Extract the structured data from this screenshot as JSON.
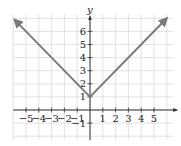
{
  "chart_data": {
    "type": "line",
    "title": "",
    "function": "y = |x| + 1",
    "xlabel": "x",
    "ylabel": "y",
    "xlim": [
      -6,
      6.5
    ],
    "ylim": [
      -2.3,
      7.3
    ],
    "grid": true,
    "x_ticks": [
      -5,
      -4,
      -3,
      -2,
      -1,
      1,
      2,
      3,
      4,
      5
    ],
    "x_tick_labels": [
      "−5",
      "−4",
      "−3",
      "−2",
      "−1",
      "1",
      "2",
      "3",
      "4",
      "5"
    ],
    "y_ticks": [
      -1,
      1,
      2,
      3,
      4,
      5,
      6
    ],
    "y_tick_labels": [
      "−1",
      "1",
      "2",
      "3",
      "4",
      "5",
      "6"
    ],
    "series": [
      {
        "name": "y = |x| + 1",
        "x": [
          -5.9,
          0,
          6.0
        ],
        "y": [
          6.9,
          1,
          7.0
        ],
        "color": "#7a7a7a",
        "arrows": "both-ends"
      }
    ],
    "vertex": {
      "x": 0,
      "y": 1
    }
  },
  "layout": {
    "origin_px": [
      90,
      110
    ],
    "unit_x_px": 12.8,
    "unit_y_px": 13.1,
    "grid_color": "#d9d9d9",
    "axis_color": "#333333",
    "line_color": "#7a7a7a"
  }
}
